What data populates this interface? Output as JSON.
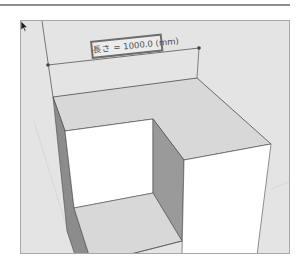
{
  "dimension": {
    "label": "長さ = 1000.0 (mm)",
    "endpoint_color": "#444444"
  },
  "colors": {
    "background": "#e4e4e4",
    "top_face": "#d8d8d8",
    "wall_dark": "#8c8c8c",
    "wall_mid": "#9a9a9a",
    "face_white": "#ffffff",
    "edge": "#4a4a4a",
    "frame": "#a8a8a8"
  },
  "icons": {
    "cursor": "arrow-pointer-icon"
  }
}
